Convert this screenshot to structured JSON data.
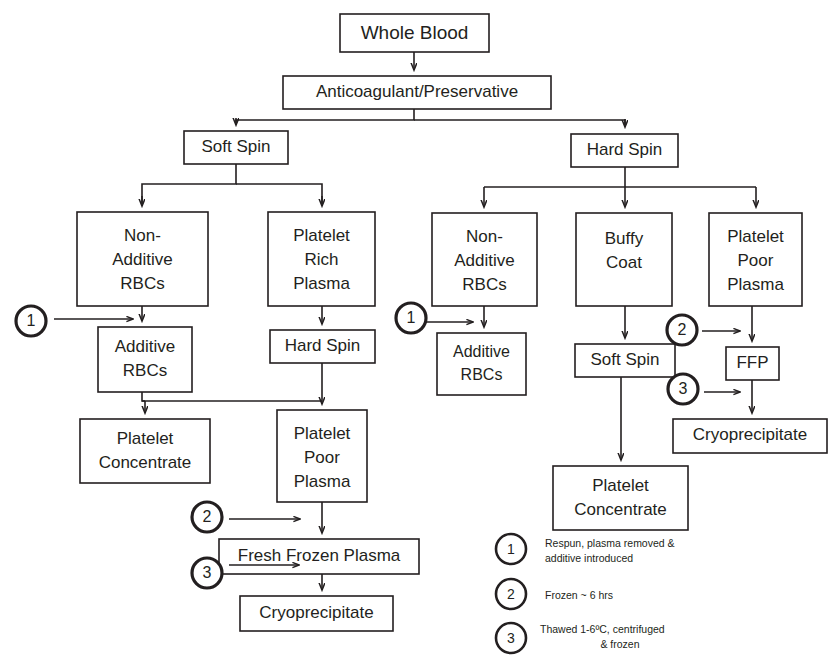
{
  "diagram": {
    "title_node": "Whole Blood",
    "nodes": [
      {
        "id": "whole_blood",
        "label": "Whole Blood",
        "lines": [
          "Whole Blood"
        ],
        "x": 340,
        "y": 14,
        "w": 149,
        "h": 38,
        "font": 19
      },
      {
        "id": "anticoagulant",
        "label": "Anticoagulant/Preservative",
        "lines": [
          "Anticoagulant/Preservative"
        ],
        "x": 283,
        "y": 76,
        "w": 268,
        "h": 33,
        "font": 17
      },
      {
        "id": "soft_spin_left",
        "label": "Soft Spin",
        "lines": [
          "Soft Spin"
        ],
        "x": 184,
        "y": 131,
        "w": 104,
        "h": 33,
        "font": 17
      },
      {
        "id": "hard_spin_right",
        "label": "Hard Spin",
        "lines": [
          "Hard Spin"
        ],
        "x": 571,
        "y": 134,
        "w": 107,
        "h": 33,
        "font": 17
      },
      {
        "id": "non_additive_left",
        "label": "Non-Additive RBCs",
        "lines": [
          "Non-",
          "Additive",
          "RBCs"
        ],
        "x": 77,
        "y": 212,
        "w": 131,
        "h": 94,
        "font": 17
      },
      {
        "id": "prp",
        "label": "Platelet Rich Plasma",
        "lines": [
          "Platelet",
          "Rich",
          "Plasma"
        ],
        "x": 268,
        "y": 212,
        "w": 107,
        "h": 94,
        "font": 17
      },
      {
        "id": "non_additive_right",
        "label": "Non-Additive RBCs",
        "lines": [
          "Non-",
          "Additive",
          "RBCs"
        ],
        "x": 432,
        "y": 213,
        "w": 105,
        "h": 93,
        "font": 17
      },
      {
        "id": "buffy_coat",
        "label": "Buffy Coat",
        "lines": [
          "Buffy",
          "Coat"
        ],
        "x": 576,
        "y": 213,
        "w": 96,
        "h": 93,
        "font": 17
      },
      {
        "id": "ppp_right",
        "label": "Platelet Poor Plasma",
        "lines": [
          "Platelet",
          "Poor",
          "Plasma"
        ],
        "x": 709,
        "y": 213,
        "w": 93,
        "h": 93,
        "font": 17
      },
      {
        "id": "additive_left",
        "label": "Additive RBCs",
        "lines": [
          "Additive",
          "RBCs"
        ],
        "x": 98,
        "y": 327,
        "w": 94,
        "h": 65,
        "font": 17
      },
      {
        "id": "hard_spin_left",
        "label": "Hard Spin",
        "lines": [
          "Hard Spin"
        ],
        "x": 270,
        "y": 330,
        "w": 105,
        "h": 33,
        "font": 17
      },
      {
        "id": "additive_right",
        "label": "Additive RBCs",
        "lines": [
          "Additive",
          "RBCs"
        ],
        "x": 437,
        "y": 333,
        "w": 89,
        "h": 62,
        "font": 16
      },
      {
        "id": "soft_spin_right",
        "label": "Soft Spin",
        "lines": [
          "Soft Spin"
        ],
        "x": 575,
        "y": 344,
        "w": 100,
        "h": 33,
        "font": 17
      },
      {
        "id": "ffp_box",
        "label": "FFP",
        "lines": [
          "FFP"
        ],
        "x": 726,
        "y": 347,
        "w": 53,
        "h": 33,
        "font": 17
      },
      {
        "id": "platelet_conc_left",
        "label": "Platelet Concentrate",
        "lines": [
          "Platelet",
          "Concentrate"
        ],
        "x": 80,
        "y": 419,
        "w": 130,
        "h": 64,
        "font": 17
      },
      {
        "id": "ppp_left",
        "label": "Platelet Poor Plasma",
        "lines": [
          "Platelet",
          "Poor",
          "Plasma"
        ],
        "x": 277,
        "y": 410,
        "w": 90,
        "h": 92,
        "font": 17
      },
      {
        "id": "cryo_right",
        "label": "Cryoprecipitate",
        "lines": [
          "Cryoprecipitate"
        ],
        "x": 673,
        "y": 419,
        "w": 154,
        "h": 34,
        "font": 17
      },
      {
        "id": "platelet_conc_right",
        "label": "Platelet Concentrate",
        "lines": [
          "Platelet",
          "Concentrate"
        ],
        "x": 553,
        "y": 466,
        "w": 135,
        "h": 64,
        "font": 17
      },
      {
        "id": "ffp_left",
        "label": "Fresh Frozen Plasma",
        "lines": [
          "Fresh Frozen Plasma"
        ],
        "x": 219,
        "y": 539,
        "w": 200,
        "h": 35,
        "font": 17
      },
      {
        "id": "cryo_left",
        "label": "Cryoprecipitate",
        "lines": [
          "Cryoprecipitate"
        ],
        "x": 240,
        "y": 596,
        "w": 153,
        "h": 35,
        "font": 17
      }
    ],
    "callouts": [
      {
        "id": "callout-1-left",
        "number": "1",
        "cx": 31,
        "cy": 321,
        "r": 15,
        "arrow_x1": 54,
        "arrow_x2": 139,
        "arrow_y": 319
      },
      {
        "id": "callout-1-right",
        "number": "1",
        "cx": 411,
        "cy": 318,
        "r": 15,
        "arrow_x1": 423,
        "arrow_x2": 478,
        "arrow_y": 322
      },
      {
        "id": "callout-2-left",
        "number": "2",
        "cx": 207,
        "cy": 517,
        "r": 15,
        "arrow_x1": 229,
        "arrow_x2": 306,
        "arrow_y": 519
      },
      {
        "id": "callout-3-left",
        "number": "3",
        "cx": 207,
        "cy": 573,
        "r": 15,
        "arrow_x1": 229,
        "arrow_x2": 304,
        "arrow_y": 565
      },
      {
        "id": "callout-2-right",
        "number": "2",
        "cx": 682,
        "cy": 330,
        "r": 15,
        "arrow_x1": 700,
        "arrow_x2": 745,
        "arrow_y": 331
      },
      {
        "id": "callout-3-right",
        "number": "3",
        "cx": 683,
        "cy": 389,
        "r": 15,
        "arrow_x1": 702,
        "arrow_x2": 745,
        "arrow_y": 392
      }
    ]
  },
  "legend": {
    "items": [
      {
        "number": "1",
        "cx": 511,
        "cy": 549,
        "lines": [
          {
            "text": "Respun, plasma removed &",
            "align": "start",
            "x": 545,
            "y": 544
          },
          {
            "text": "additive introduced",
            "align": "start",
            "x": 545,
            "y": 559
          }
        ]
      },
      {
        "number": "2",
        "cx": 511,
        "cy": 594,
        "lines": [
          {
            "text": "Frozen ~ 6 hrs",
            "align": "start",
            "x": 545,
            "y": 597
          }
        ]
      },
      {
        "number": "3",
        "cx": 511,
        "cy": 638,
        "lines": [
          {
            "text": "Thawed 1-6ºC, centrifuged",
            "align": "start",
            "x": 540,
            "y": 630
          },
          {
            "text": "& frozen",
            "align": "middle",
            "x": 620,
            "y": 645
          }
        ]
      }
    ]
  },
  "colors": {
    "ink": "#231f20",
    "paper": "#ffffff"
  }
}
